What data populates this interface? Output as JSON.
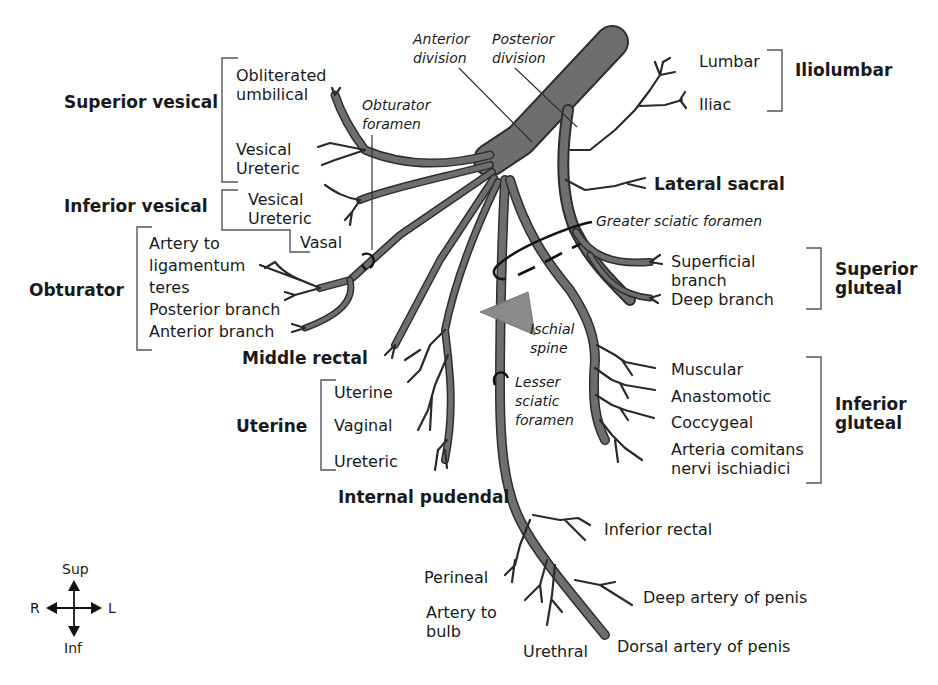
{
  "diagram": {
    "colors": {
      "vessel_fill": "#6e6e6e",
      "vessel_outline": "#2e2e2e",
      "ischial_spine": "#8a8a8a",
      "text": "#1a1a1a",
      "background": "#ffffff"
    },
    "divisions": {
      "anterior": "Anterior\ndivision",
      "posterior": "Posterior\ndivision"
    },
    "foramina": {
      "obturator": "Obturator\nforamen",
      "greater_sciatic": "Greater sciatic foramen",
      "lesser_sciatic": "Lesser\nsciatic\nforamen",
      "ischial_spine": "Ischial\nspine"
    },
    "groups": {
      "superior_vesical": {
        "name": "Superior vesical",
        "branches": [
          "Obliterated\numbilical",
          "Vesical\nUreteric"
        ]
      },
      "inferior_vesical": {
        "name": "Inferior vesical",
        "branches": [
          "Vesical\nUreteric",
          "Vasal"
        ]
      },
      "obturator": {
        "name": "Obturator",
        "branches": [
          "Artery to\nligamentum\nteres\nPosterior branch\nAnterior branch"
        ]
      },
      "middle_rectal": {
        "name": "Middle rectal"
      },
      "uterine": {
        "name": "Uterine",
        "branches": [
          "Uterine",
          "Vaginal",
          "Ureteric"
        ]
      },
      "internal_pudendal": {
        "name": "Internal pudendal",
        "branches": [
          "Inferior rectal",
          "Perineal",
          "Artery to\nbulb",
          "Urethral",
          "Deep artery of penis",
          "Dorsal artery of penis"
        ]
      },
      "iliolumbar": {
        "name": "Iliolumbar",
        "branches": [
          "Lumbar",
          "Iliac"
        ]
      },
      "lateral_sacral": {
        "name": "Lateral sacral"
      },
      "superior_gluteal": {
        "name": "Superior\ngluteal",
        "branches": [
          "Superficial\nbranch\nDeep branch"
        ]
      },
      "inferior_gluteal": {
        "name": "Inferior\ngluteal",
        "branches": [
          "Muscular",
          "Anastomotic",
          "Coccygeal",
          "Arteria comitans\nnervi ischiadici"
        ]
      }
    },
    "orientation": {
      "sup": "Sup",
      "inf": "Inf",
      "right": "R",
      "left": "L"
    }
  }
}
